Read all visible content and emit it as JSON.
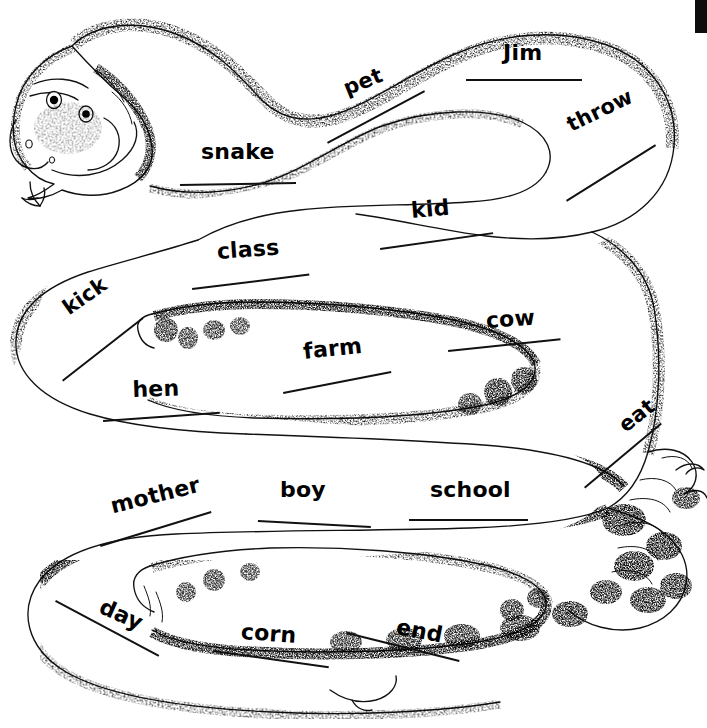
{
  "page": {
    "background_color": "#ffffff",
    "ink_color": "#000000",
    "width": 707,
    "height": 728
  },
  "artwork": {
    "subject": "coiled rattlesnake line drawing",
    "description": "A long stippled rattlesnake coiled back and forth in three horizontal switchbacks, head at upper left with forked tongue, rattle at lower right",
    "features": [
      "snake-head",
      "forked-tongue",
      "eye-left",
      "eye-right",
      "nostril",
      "body-coil-upper",
      "body-coil-middle",
      "body-coil-lower",
      "rattle-tail"
    ]
  },
  "scan_artifact": {
    "name": "black-edge-bar",
    "color": "#0d0d0d",
    "x": 695,
    "y": 0,
    "width": 12,
    "height": 33
  },
  "words": [
    {
      "text": "snake",
      "x": 201,
      "y": 139,
      "rotate": 0,
      "size": 22,
      "rule": {
        "x": 180,
        "y": 184,
        "length": 116,
        "rotate": -1
      }
    },
    {
      "text": "pet",
      "x": 340,
      "y": 78,
      "rotate": -22,
      "size": 21,
      "rule": {
        "x": 327,
        "y": 142,
        "length": 110,
        "rotate": -28
      }
    },
    {
      "text": "Jim",
      "x": 503,
      "y": 40,
      "rotate": 0,
      "size": 22,
      "rule": {
        "x": 466,
        "y": 79,
        "length": 116,
        "rotate": 0
      }
    },
    {
      "text": "throw",
      "x": 563,
      "y": 115,
      "rotate": -26,
      "size": 21,
      "rule": {
        "x": 566,
        "y": 200,
        "length": 105,
        "rotate": -32
      }
    },
    {
      "text": "kid",
      "x": 410,
      "y": 198,
      "rotate": -5,
      "size": 22,
      "rule": {
        "x": 380,
        "y": 248,
        "length": 114,
        "rotate": -8
      }
    },
    {
      "text": "class",
      "x": 216,
      "y": 239,
      "rotate": -4,
      "size": 22,
      "rule": {
        "x": 192,
        "y": 288,
        "length": 118,
        "rotate": -7
      }
    },
    {
      "text": "kick",
      "x": 58,
      "y": 300,
      "rotate": -35,
      "size": 21,
      "rule": {
        "x": 62,
        "y": 380,
        "length": 102,
        "rotate": -38
      }
    },
    {
      "text": "farm",
      "x": 302,
      "y": 339,
      "rotate": -6,
      "size": 22,
      "rule": {
        "x": 283,
        "y": 392,
        "length": 110,
        "rotate": -11
      }
    },
    {
      "text": "cow",
      "x": 485,
      "y": 308,
      "rotate": -4,
      "size": 22,
      "rule": {
        "x": 448,
        "y": 350,
        "length": 113,
        "rotate": -6
      }
    },
    {
      "text": "hen",
      "x": 132,
      "y": 377,
      "rotate": -2,
      "size": 22,
      "rule": {
        "x": 103,
        "y": 420,
        "length": 117,
        "rotate": -4
      }
    },
    {
      "text": "eat",
      "x": 614,
      "y": 418,
      "rotate": -38,
      "size": 21,
      "rule": {
        "x": 584,
        "y": 487,
        "length": 100,
        "rotate": -40
      }
    },
    {
      "text": "mother",
      "x": 108,
      "y": 494,
      "rotate": -14,
      "size": 22,
      "rule": {
        "x": 100,
        "y": 545,
        "length": 116,
        "rotate": -17
      }
    },
    {
      "text": "boy",
      "x": 280,
      "y": 477,
      "rotate": 0,
      "size": 22,
      "rule": {
        "x": 258,
        "y": 520,
        "length": 113,
        "rotate": 3
      }
    },
    {
      "text": "school",
      "x": 430,
      "y": 477,
      "rotate": 0,
      "size": 22,
      "rule": {
        "x": 409,
        "y": 519,
        "length": 119,
        "rotate": 0
      }
    },
    {
      "text": "day",
      "x": 106,
      "y": 594,
      "rotate": 24,
      "size": 22,
      "rule": {
        "x": 56,
        "y": 600,
        "length": 117,
        "rotate": 28
      }
    },
    {
      "text": "corn",
      "x": 242,
      "y": 619,
      "rotate": 4,
      "size": 22,
      "rule": {
        "x": 213,
        "y": 650,
        "length": 117,
        "rotate": 8
      }
    },
    {
      "text": "end",
      "x": 399,
      "y": 614,
      "rotate": 11,
      "size": 22,
      "rule": {
        "x": 347,
        "y": 632,
        "length": 116,
        "rotate": 14
      }
    }
  ]
}
